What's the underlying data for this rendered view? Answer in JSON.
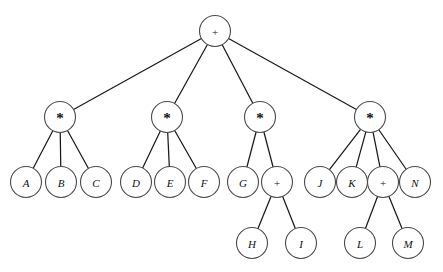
{
  "figure": {
    "width": 443,
    "height": 272,
    "background_color": "#ffffff",
    "edge_color": "#1a1a1a",
    "node_fill": "#ffffff",
    "node_stroke": "#4a4a4a",
    "label_color": "#111111",
    "node_radius": 15.5
  },
  "symbols": {
    "plus": "+",
    "times": "*"
  },
  "nodes": [
    {
      "id": "root",
      "label": "+",
      "kind": "plus",
      "x": 215,
      "y": 31,
      "depth": 0
    },
    {
      "id": "m1",
      "label": "*",
      "kind": "times",
      "x": 60,
      "y": 117,
      "depth": 1
    },
    {
      "id": "m2",
      "label": "*",
      "kind": "times",
      "x": 167,
      "y": 117,
      "depth": 1
    },
    {
      "id": "m3",
      "label": "*",
      "kind": "times",
      "x": 260,
      "y": 117,
      "depth": 1
    },
    {
      "id": "m4",
      "label": "*",
      "kind": "times",
      "x": 370,
      "y": 117,
      "depth": 1
    },
    {
      "id": "A",
      "label": "A",
      "kind": "operand",
      "x": 26,
      "y": 182,
      "depth": 2
    },
    {
      "id": "B",
      "label": "B",
      "kind": "operand",
      "x": 61,
      "y": 182,
      "depth": 2
    },
    {
      "id": "C",
      "label": "C",
      "kind": "operand",
      "x": 96,
      "y": 182,
      "depth": 2
    },
    {
      "id": "D",
      "label": "D",
      "kind": "operand",
      "x": 136,
      "y": 182,
      "depth": 2
    },
    {
      "id": "E",
      "label": "E",
      "kind": "operand",
      "x": 170,
      "y": 182,
      "depth": 2
    },
    {
      "id": "F",
      "label": "F",
      "kind": "operand",
      "x": 204,
      "y": 182,
      "depth": 2
    },
    {
      "id": "G",
      "label": "G",
      "kind": "operand",
      "x": 243,
      "y": 182,
      "depth": 2
    },
    {
      "id": "p1",
      "label": "+",
      "kind": "plus",
      "x": 277,
      "y": 182,
      "depth": 2
    },
    {
      "id": "J",
      "label": "J",
      "kind": "operand",
      "x": 320,
      "y": 182,
      "depth": 2
    },
    {
      "id": "K",
      "label": "K",
      "kind": "operand",
      "x": 352,
      "y": 182,
      "depth": 2
    },
    {
      "id": "p2",
      "label": "+",
      "kind": "plus",
      "x": 383,
      "y": 182,
      "depth": 2
    },
    {
      "id": "N",
      "label": "N",
      "kind": "operand",
      "x": 415,
      "y": 182,
      "depth": 2
    },
    {
      "id": "H",
      "label": "H",
      "kind": "operand",
      "x": 252,
      "y": 243,
      "depth": 3
    },
    {
      "id": "I",
      "label": "I",
      "kind": "operand",
      "x": 301,
      "y": 243,
      "depth": 3
    },
    {
      "id": "L",
      "label": "L",
      "kind": "operand",
      "x": 360,
      "y": 243,
      "depth": 3
    },
    {
      "id": "M",
      "label": "M",
      "kind": "operand",
      "x": 408,
      "y": 243,
      "depth": 3
    }
  ],
  "edges": [
    {
      "from": "root",
      "to": "m1"
    },
    {
      "from": "root",
      "to": "m2"
    },
    {
      "from": "root",
      "to": "m3"
    },
    {
      "from": "root",
      "to": "m4"
    },
    {
      "from": "m1",
      "to": "A"
    },
    {
      "from": "m1",
      "to": "B"
    },
    {
      "from": "m1",
      "to": "C"
    },
    {
      "from": "m2",
      "to": "D"
    },
    {
      "from": "m2",
      "to": "E"
    },
    {
      "from": "m2",
      "to": "F"
    },
    {
      "from": "m3",
      "to": "G"
    },
    {
      "from": "m3",
      "to": "p1"
    },
    {
      "from": "m4",
      "to": "J"
    },
    {
      "from": "m4",
      "to": "K"
    },
    {
      "from": "m4",
      "to": "p2"
    },
    {
      "from": "m4",
      "to": "N"
    },
    {
      "from": "p1",
      "to": "H"
    },
    {
      "from": "p1",
      "to": "I"
    },
    {
      "from": "p2",
      "to": "L"
    },
    {
      "from": "p2",
      "to": "M"
    }
  ]
}
